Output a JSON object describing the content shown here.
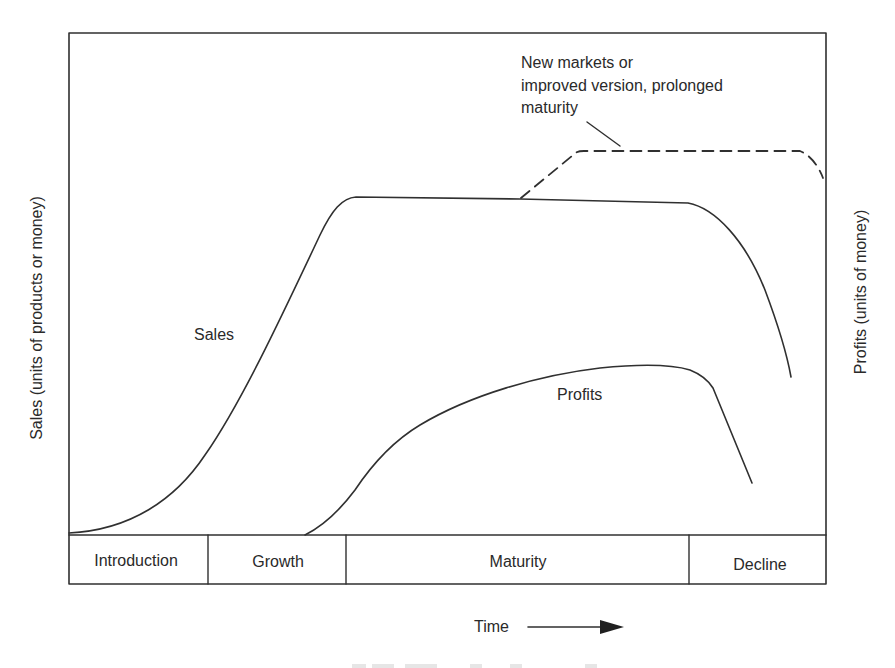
{
  "diagram": {
    "type": "product-life-cycle",
    "y_axis_left_label": "Sales (units of products or money)",
    "y_axis_right_label": "Profits (units of money)",
    "x_axis_label": "Time",
    "curves": {
      "sales_label": "Sales",
      "profits_label": "Profits"
    },
    "annotation": {
      "lines": [
        "New markets or",
        "improved version, prolonged",
        "maturity"
      ]
    },
    "stages": [
      {
        "label": "Introduction"
      },
      {
        "label": "Growth"
      },
      {
        "label": "Maturity"
      },
      {
        "label": "Decline"
      }
    ],
    "colors": {
      "line": "#303030",
      "text": "#2a2a2a",
      "background": "#ffffff"
    }
  }
}
